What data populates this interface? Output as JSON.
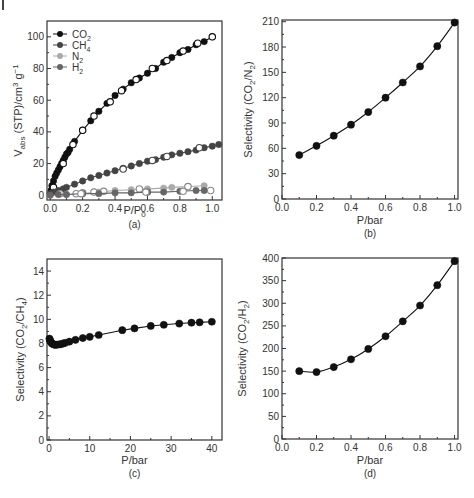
{
  "figure": {
    "corner_mark": true
  },
  "chart_data": [
    {
      "id": "a",
      "panel_label": "(a)",
      "type": "scatter",
      "title": "",
      "xlabel": "P/P0",
      "xlabel_main": "P/P",
      "xlabel_sub": "0",
      "ylabel": "Vabs (STP)/cm3 g-1",
      "ylabel_parts": [
        {
          "t": "V",
          "s": "n"
        },
        {
          "t": "abs",
          "s": "sub"
        },
        {
          "t": " (STP)/cm",
          "s": "n"
        },
        {
          "t": "3",
          "s": "sup"
        },
        {
          "t": " g",
          "s": "n"
        },
        {
          "t": "−1",
          "s": "sup"
        }
      ],
      "xlim": [
        -0.02,
        1.06
      ],
      "ylim": [
        -3,
        110
      ],
      "xticks": [
        0.0,
        0.2,
        0.4,
        0.6,
        0.8,
        1.0
      ],
      "xtick_labels": [
        "0.0",
        "0.2",
        "0.4",
        "0.6",
        "0.8",
        "1.0"
      ],
      "yticks": [
        0,
        20,
        40,
        60,
        80,
        100
      ],
      "ytick_labels": [
        "0",
        "20",
        "40",
        "60",
        "80",
        "100"
      ],
      "grid": false,
      "legend": {
        "position": "upper-left",
        "entries": [
          {
            "label": "CO",
            "sub": "2",
            "color": "#111111"
          },
          {
            "label": "CH",
            "sub": "4",
            "color": "#444444"
          },
          {
            "label": "N",
            "sub": "2",
            "color": "#aaaaaa"
          },
          {
            "label": "H",
            "sub": "2",
            "color": "#666666"
          }
        ]
      },
      "series": [
        {
          "name": "CO2 adsorption",
          "color": "#111111",
          "fill": "filled",
          "x": [
            0.005,
            0.01,
            0.02,
            0.03,
            0.04,
            0.05,
            0.06,
            0.07,
            0.08,
            0.09,
            0.1,
            0.11,
            0.12,
            0.15,
            0.2,
            0.25,
            0.3,
            0.35,
            0.4,
            0.45,
            0.5,
            0.55,
            0.6,
            0.65,
            0.7,
            0.75,
            0.8,
            0.85,
            0.9,
            0.95,
            1.0
          ],
          "y": [
            3,
            6,
            9,
            12,
            14,
            16,
            18,
            20,
            22,
            24,
            26,
            27,
            29,
            34,
            41,
            47,
            53,
            58,
            63,
            67,
            71,
            74,
            77,
            80,
            84,
            87,
            90,
            92,
            95,
            97,
            100
          ]
        },
        {
          "name": "CO2 desorption",
          "color": "#111111",
          "fill": "open",
          "x": [
            0.02,
            0.08,
            0.14,
            0.2,
            0.27,
            0.37,
            0.44,
            0.53,
            0.63,
            0.72,
            0.82,
            0.91,
            1.0
          ],
          "y": [
            5,
            20,
            32,
            41,
            50,
            59,
            66,
            73,
            80,
            85,
            91,
            96,
            100
          ],
          "line": false
        },
        {
          "name": "CH4 adsorption",
          "color": "#444444",
          "fill": "filled",
          "x": [
            0.0,
            0.02,
            0.05,
            0.08,
            0.1,
            0.15,
            0.2,
            0.25,
            0.3,
            0.35,
            0.4,
            0.45,
            0.5,
            0.55,
            0.6,
            0.65,
            0.7,
            0.75,
            0.8,
            0.85,
            0.9,
            0.95,
            1.0,
            1.04
          ],
          "y": [
            1,
            2,
            3,
            4,
            5,
            7,
            9,
            11,
            12.5,
            14,
            15.5,
            17,
            18.5,
            20,
            21.5,
            22.5,
            24,
            25.5,
            26.5,
            27.5,
            28.5,
            30,
            31,
            32
          ]
        },
        {
          "name": "CH4 desorption",
          "color": "#444444",
          "fill": "open",
          "x": [
            0.45,
            0.63,
            0.72,
            0.92
          ],
          "y": [
            16.5,
            22,
            24.5,
            30
          ],
          "line": false
        },
        {
          "name": "N2 adsorption",
          "color": "#aaaaaa",
          "fill": "filled",
          "x": [
            0.1,
            0.2,
            0.3,
            0.4,
            0.5,
            0.6,
            0.7,
            0.75,
            0.85,
            0.95
          ],
          "y": [
            0.5,
            1,
            2,
            3,
            3.5,
            4,
            4.5,
            5,
            5.5,
            6
          ]
        },
        {
          "name": "N2 desorption",
          "color": "#888888",
          "fill": "open",
          "x": [
            0.06,
            0.16,
            0.2,
            0.27,
            0.33,
            0.55,
            0.6,
            0.85
          ],
          "y": [
            1,
            1,
            1.5,
            2,
            2.5,
            4,
            2,
            5.5
          ],
          "line": false
        },
        {
          "name": "H2 adsorption",
          "color": "#666666",
          "fill": "filled",
          "x": [
            0.0,
            0.05,
            0.1,
            0.2,
            0.3,
            0.4,
            0.5,
            0.6,
            0.7,
            0.8,
            0.9,
            0.95
          ],
          "y": [
            0,
            0.5,
            0.5,
            1,
            1,
            1.5,
            1.5,
            2,
            2,
            2.5,
            3,
            3
          ]
        },
        {
          "name": "H2 desorption",
          "color": "#888888",
          "fill": "open",
          "x": [
            0.19,
            0.59,
            0.82,
            0.99
          ],
          "y": [
            1,
            2,
            2.5,
            3
          ],
          "line": false
        }
      ]
    },
    {
      "id": "b",
      "panel_label": "(b)",
      "type": "line",
      "title": "",
      "xlabel": "P/bar",
      "ylabel": "Selectivity (CO2/N2)",
      "ylabel_parts": [
        {
          "t": "Selectivity (CO",
          "s": "n"
        },
        {
          "t": "2",
          "s": "sub"
        },
        {
          "t": "/N",
          "s": "n"
        },
        {
          "t": "2",
          "s": "sub"
        },
        {
          "t": ")",
          "s": "n"
        }
      ],
      "xlim": [
        0.0,
        1.02
      ],
      "ylim": [
        0,
        212
      ],
      "xticks": [
        0.0,
        0.2,
        0.4,
        0.6,
        0.8,
        1.0
      ],
      "xtick_labels": [
        "0.0",
        "0.2",
        "0.4",
        "0.6",
        "0.8",
        "1.0"
      ],
      "yticks": [
        0,
        30,
        60,
        90,
        120,
        150,
        180,
        210
      ],
      "ytick_labels": [
        "0",
        "30",
        "60",
        "90",
        "120",
        "150",
        "180",
        "210"
      ],
      "grid": false,
      "series": [
        {
          "name": "CO2/N2",
          "color": "#111111",
          "fill": "filled",
          "smooth": true,
          "x": [
            0.1,
            0.2,
            0.3,
            0.4,
            0.5,
            0.6,
            0.7,
            0.8,
            0.9,
            1.0
          ],
          "y": [
            52,
            63,
            75,
            88,
            103,
            120,
            138,
            157,
            181,
            209
          ]
        }
      ]
    },
    {
      "id": "c",
      "panel_label": "(c)",
      "type": "line",
      "title": "",
      "xlabel": "P/bar",
      "ylabel": "Selectivity (CO2/CH4)",
      "ylabel_parts": [
        {
          "t": "Selectivity (CO",
          "s": "n"
        },
        {
          "t": "2",
          "s": "sub"
        },
        {
          "t": "/CH",
          "s": "n"
        },
        {
          "t": "4",
          "s": "sub"
        },
        {
          "t": ")",
          "s": "n"
        }
      ],
      "xlim": [
        -0.5,
        42.5
      ],
      "ylim": [
        0,
        15
      ],
      "xticks": [
        0,
        10,
        20,
        30,
        40
      ],
      "xtick_labels": [
        "0",
        "10",
        "20",
        "30",
        "40"
      ],
      "yticks": [
        0,
        2,
        4,
        6,
        8,
        10,
        12,
        14
      ],
      "ytick_labels": [
        "0",
        "2",
        "4",
        "6",
        "8",
        "10",
        "12",
        "14"
      ],
      "grid": false,
      "series": [
        {
          "name": "CO2/CH4",
          "color": "#111111",
          "fill": "filled",
          "smooth": false,
          "x": [
            0.1,
            0.2,
            0.3,
            0.5,
            0.7,
            1.0,
            1.3,
            1.6,
            2.0,
            2.5,
            3.0,
            3.5,
            4.0,
            5.0,
            6.5,
            8.3,
            10.0,
            12.2,
            18.0,
            21.0,
            25.0,
            28.2,
            32.0,
            35.0,
            37.0,
            40.0
          ],
          "y": [
            8.4,
            8.3,
            8.2,
            8.1,
            8.0,
            7.95,
            7.9,
            7.88,
            7.9,
            7.92,
            7.95,
            8.0,
            8.05,
            8.15,
            8.3,
            8.45,
            8.55,
            8.7,
            9.1,
            9.25,
            9.45,
            9.55,
            9.65,
            9.72,
            9.75,
            9.8
          ]
        }
      ]
    },
    {
      "id": "d",
      "panel_label": "(d)",
      "type": "line",
      "title": "",
      "xlabel": "P/bar",
      "ylabel": "Selectivity (CO2/H2)",
      "ylabel_parts": [
        {
          "t": "Selectivity (CO",
          "s": "n"
        },
        {
          "t": "2",
          "s": "sub"
        },
        {
          "t": "/H",
          "s": "n"
        },
        {
          "t": "2",
          "s": "sub"
        },
        {
          "t": ")",
          "s": "n"
        }
      ],
      "xlim": [
        0.0,
        1.02
      ],
      "ylim": [
        0,
        400
      ],
      "xticks": [
        0.0,
        0.2,
        0.4,
        0.6,
        0.8,
        1.0
      ],
      "xtick_labels": [
        "0.0",
        "0.2",
        "0.4",
        "0.6",
        "0.8",
        "1.0"
      ],
      "yticks": [
        0,
        50,
        100,
        150,
        200,
        250,
        300,
        350,
        400
      ],
      "ytick_labels": [
        "0",
        "50",
        "100",
        "150",
        "200",
        "250",
        "300",
        "350",
        "400"
      ],
      "grid": false,
      "series": [
        {
          "name": "CO2/H2",
          "color": "#111111",
          "fill": "filled",
          "smooth": true,
          "x": [
            0.1,
            0.2,
            0.3,
            0.4,
            0.5,
            0.6,
            0.7,
            0.8,
            0.9,
            1.0
          ],
          "y": [
            150,
            148,
            159,
            176,
            199,
            227,
            260,
            295,
            340,
            393
          ]
        }
      ]
    }
  ],
  "layout": {
    "panels": {
      "a": {
        "frame": [
          47,
          21,
          222,
          200
        ],
        "label_y": 228,
        "xlabel_y": 214,
        "ylabel_x": 22
      },
      "b": {
        "frame": [
          282,
          20,
          458,
          199
        ],
        "label_y": 237,
        "xlabel_y": 224,
        "ylabel_x": 252
      },
      "c": {
        "frame": [
          47,
          259,
          222,
          440
        ],
        "label_y": 477,
        "xlabel_y": 464,
        "ylabel_x": 24
      },
      "d": {
        "frame": [
          282,
          258,
          458,
          439
        ],
        "label_y": 477,
        "xlabel_y": 464,
        "ylabel_x": 246
      }
    }
  }
}
